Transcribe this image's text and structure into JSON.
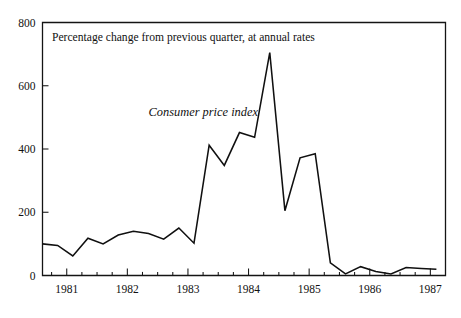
{
  "chart_data": {
    "type": "line",
    "title": "Percentage change from previous quarter, at annual rates",
    "annotations": [
      {
        "name": "series-label",
        "text": "Consumer price index",
        "x": 1982.35,
        "y": 505
      }
    ],
    "xlabel": "",
    "ylabel": "",
    "xlim": [
      1980.6,
      1987.25
    ],
    "ylim": [
      0,
      800
    ],
    "grid": false,
    "legend": null,
    "yticks": [
      0,
      200,
      400,
      600,
      800
    ],
    "ytick_labels": [
      "0",
      "200",
      "400",
      "600",
      "800"
    ],
    "xticks": [
      1981,
      1982,
      1983,
      1984,
      1985,
      1986,
      1987
    ],
    "xtick_labels": [
      "1981",
      "1982",
      "1983",
      "1984",
      "1985",
      "1986",
      "1987"
    ],
    "minor_xtick_interval": 0.25,
    "series": [
      {
        "name": "Consumer price index",
        "color": "#101010",
        "x": [
          1980.6,
          1980.85,
          1981.1,
          1981.35,
          1981.6,
          1981.85,
          1982.1,
          1982.35,
          1982.6,
          1982.85,
          1983.1,
          1983.35,
          1983.6,
          1983.85,
          1984.1,
          1984.35,
          1984.6,
          1984.85,
          1985.1,
          1985.35,
          1985.6,
          1985.85,
          1986.1,
          1986.35,
          1986.6,
          1986.85,
          1987.1
        ],
        "values": [
          100,
          95,
          62,
          118,
          100,
          128,
          140,
          133,
          115,
          150,
          102,
          412,
          348,
          452,
          437,
          705,
          205,
          372,
          385,
          40,
          5,
          28,
          13,
          5,
          25,
          22,
          20
        ]
      }
    ]
  }
}
